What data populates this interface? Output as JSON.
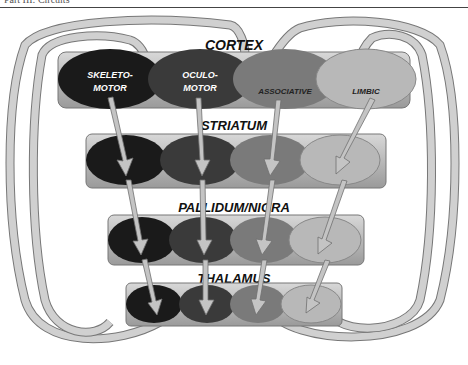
{
  "header": {
    "text": "Part III: Circuits"
  },
  "diagram": {
    "layers": [
      {
        "name": "CORTEX"
      },
      {
        "name": "STRIATUM"
      },
      {
        "name": "PALLIDUM/NIGRA"
      },
      {
        "name": "THALAMUS"
      }
    ],
    "loops": [
      {
        "name": "SKELETO-MOTOR",
        "line1": "SKELETO-",
        "line2": "MOTOR",
        "color": "#1a1a1a"
      },
      {
        "name": "OCULO-MOTOR",
        "line1": "OCULO-",
        "line2": "MOTOR",
        "color": "#3a3a3a"
      },
      {
        "name": "ASSOCIATIVE",
        "line1": "ASSOCIATIVE",
        "line2": "",
        "color": "#7a7a7a"
      },
      {
        "name": "LIMBIC",
        "line1": "LIMBIC",
        "line2": "",
        "color": "#b8b8b8"
      }
    ],
    "colors": {
      "bar": "#a8a8a8",
      "arrow": "#c4c4c4",
      "arrow_stroke": "#707070"
    }
  }
}
